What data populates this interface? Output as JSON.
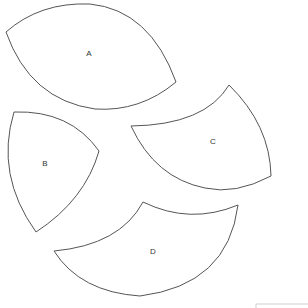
{
  "diagram": {
    "shapes": [
      {
        "id": "A",
        "label": "A"
      },
      {
        "id": "B",
        "label": "B"
      },
      {
        "id": "C",
        "label": "C"
      },
      {
        "id": "D",
        "label": "D"
      }
    ]
  }
}
